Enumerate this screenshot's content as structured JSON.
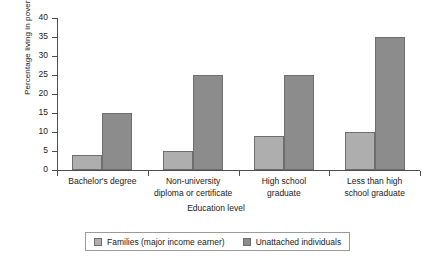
{
  "chart_data": {
    "type": "bar",
    "title": "",
    "subtitle": "",
    "xlabel": "Education level",
    "ylabel": "Percentage living in poverty",
    "ylim": [
      0,
      40
    ],
    "yticks": [
      0,
      5,
      10,
      15,
      20,
      25,
      30,
      35,
      40
    ],
    "grid": false,
    "legend_position": "bottom",
    "categories": [
      "Bachelor's degree",
      "Non-university diploma or certificate",
      "High school graduate",
      "Less than high school graduate"
    ],
    "series": [
      {
        "name": "Families (major income earner)",
        "color": "#aeaeae",
        "values": [
          4,
          5,
          9,
          10
        ]
      },
      {
        "name": "Unattached individuals",
        "color": "#8c8c8c",
        "values": [
          15,
          25,
          25,
          35
        ]
      }
    ]
  },
  "axis": {
    "y_title": "Percentage living in poverty",
    "x_title": "Education level",
    "y_tick_labels": [
      "40",
      "35",
      "30",
      "25",
      "20",
      "15",
      "10",
      "5",
      "0"
    ],
    "x_category_lines": [
      [
        "Bachelor's degree"
      ],
      [
        "Non-university",
        "diploma or certificate"
      ],
      [
        "High school",
        "graduate"
      ],
      [
        "Less than high",
        "school graduate"
      ]
    ]
  },
  "legend": {
    "entries": [
      {
        "label": "Families (major income earner)",
        "color": "#aeaeae"
      },
      {
        "label": "Unattached individuals",
        "color": "#8c8c8c"
      }
    ]
  }
}
